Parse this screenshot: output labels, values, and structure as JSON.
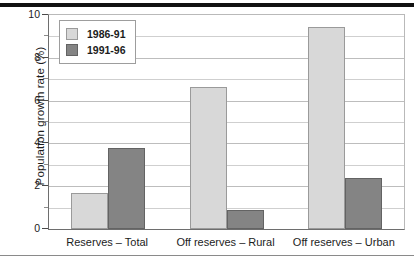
{
  "chart_data": {
    "type": "bar",
    "title": "",
    "subtitle": "",
    "xlabel": "",
    "ylabel": "Population growth rate (%)",
    "categories": [
      "Reserves – Total",
      "Off reserves – Rural",
      "Off reserves – Urban"
    ],
    "series": [
      {
        "name": "1986-91",
        "color": "#d8d8d8",
        "values": [
          1.7,
          6.65,
          9.45
        ]
      },
      {
        "name": "1991-96",
        "color": "#848484",
        "values": [
          3.8,
          0.9,
          2.4
        ]
      }
    ],
    "ylim": [
      0,
      10
    ],
    "ytick_labels": [
      "0",
      "2",
      "4",
      "6",
      "8",
      "10"
    ],
    "ytick_values": [
      0,
      2,
      4,
      6,
      8,
      10
    ],
    "yminor_values": [
      1,
      3,
      5,
      7,
      9
    ],
    "grid": "horizontal",
    "legend_position": "upper-left-inside",
    "legend_entries": [
      "1986-91",
      "1991-96"
    ]
  }
}
